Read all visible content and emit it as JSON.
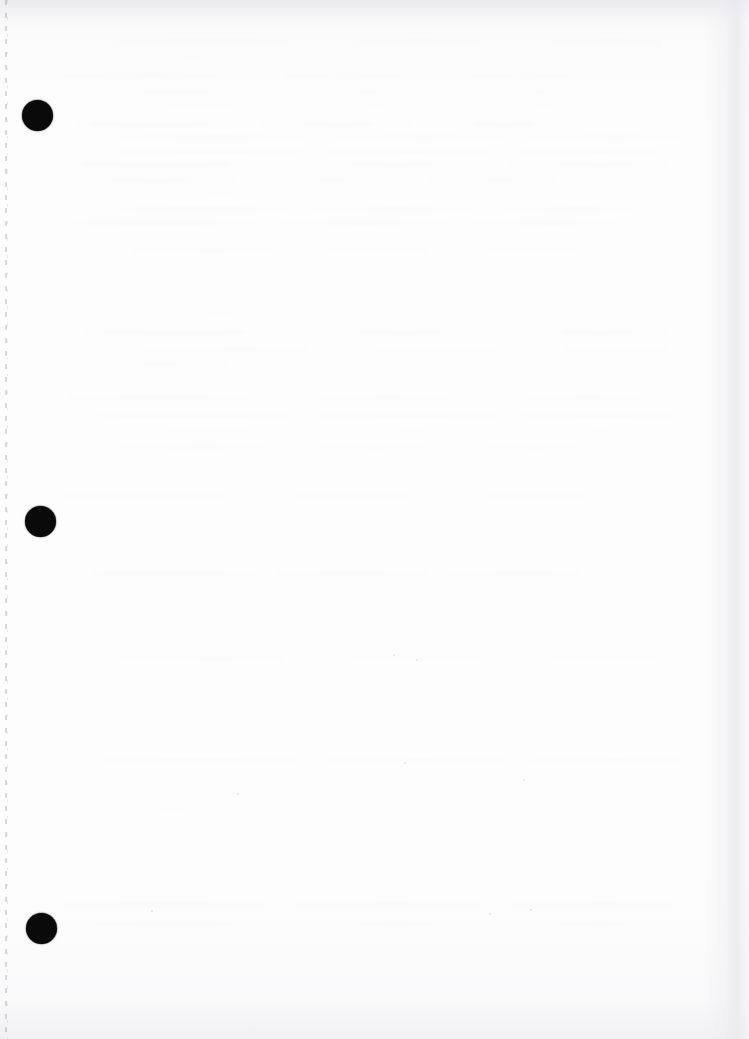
{
  "document": {
    "type": "scanned-page",
    "title": "Scanned blank page",
    "description": "Blank scanned sheet of paper with three solid black binding-hole marks along the left margin and a faint dashed vertical guide line at the left edge.",
    "page_width": 749,
    "page_height": 1039,
    "visible_text": "",
    "has_body_text": false,
    "paper_color": "#fdfdfd",
    "ink_color": "#0a0a0a"
  },
  "binding_guide": {
    "name": "dashed-vertical-guide",
    "x": 5,
    "top": 0,
    "bottom": 1039,
    "style": "dashed",
    "color": "#000000",
    "opacity": 0.42
  },
  "hole_marks": [
    {
      "label": "hole-mark-1",
      "cx": 37,
      "cy": 115,
      "diameter": 31,
      "color": "#0a0a0a"
    },
    {
      "label": "hole-mark-2",
      "cx": 40,
      "cy": 521,
      "diameter": 31,
      "color": "#0a0a0a"
    },
    {
      "label": "hole-mark-3",
      "cx": 41,
      "cy": 928,
      "diameter": 31,
      "color": "#0a0a0a"
    }
  ],
  "bleed_through": {
    "name": "reverse-side-text-ghost",
    "legible": false,
    "region": {
      "left": 55,
      "top": 34,
      "width": 660,
      "height": 900
    },
    "note": "Faint unreadable show-through of text printed on the reverse of the sheet."
  },
  "specks": [
    {
      "x": 393,
      "y": 654,
      "size": 2
    },
    {
      "x": 416,
      "y": 659,
      "size": 2
    },
    {
      "x": 237,
      "y": 793,
      "size": 2
    },
    {
      "x": 404,
      "y": 762,
      "size": 2
    },
    {
      "x": 523,
      "y": 779,
      "size": 2
    },
    {
      "x": 489,
      "y": 913,
      "size": 2
    },
    {
      "x": 530,
      "y": 909,
      "size": 2
    },
    {
      "x": 151,
      "y": 910,
      "size": 2
    }
  ],
  "edges": {
    "right_shadow_color": "#e9e9ed",
    "top_shadow_color": "#e8e8ec",
    "bottom_shadow_color": "#ececef"
  }
}
